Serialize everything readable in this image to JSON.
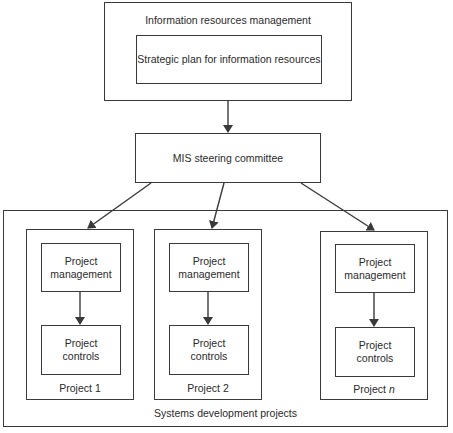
{
  "diagram": {
    "irm": {
      "title": "Information resources management",
      "strategic_plan": "Strategic plan for information resources"
    },
    "steering": {
      "label": "MIS steering committee"
    },
    "systems": {
      "label": "Systems development projects",
      "projects": [
        {
          "name_prefix": "Project",
          "name_suffix": "1",
          "suffix_italic": false,
          "management": "Project\nmanagement",
          "controls": "Project\ncontrols"
        },
        {
          "name_prefix": "Project",
          "name_suffix": "2",
          "suffix_italic": false,
          "management": "Project\nmanagement",
          "controls": "Project\ncontrols"
        },
        {
          "name_prefix": "Project",
          "name_suffix": "n",
          "suffix_italic": true,
          "management": "Project\nmanagement",
          "controls": "Project\ncontrols"
        }
      ]
    },
    "line_color": "#3a3a3a"
  }
}
